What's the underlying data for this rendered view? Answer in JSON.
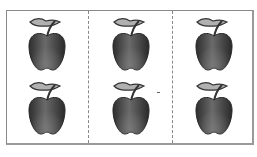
{
  "sheet": {
    "columns": 3,
    "rows": 2,
    "border_color": "#8a8a8a",
    "divider_style": "dashed",
    "cells": [
      {
        "row": 1,
        "col": 1,
        "icon": "apple-icon"
      },
      {
        "row": 1,
        "col": 2,
        "icon": "apple-icon"
      },
      {
        "row": 1,
        "col": 3,
        "icon": "apple-icon"
      },
      {
        "row": 2,
        "col": 1,
        "icon": "apple-icon"
      },
      {
        "row": 2,
        "col": 2,
        "icon": "apple-icon"
      },
      {
        "row": 2,
        "col": 3,
        "icon": "apple-icon"
      }
    ],
    "colors": {
      "apple_dark": "#2e2e2e",
      "apple_mid": "#6a6a6a",
      "leaf": "#9a9a9a"
    }
  }
}
